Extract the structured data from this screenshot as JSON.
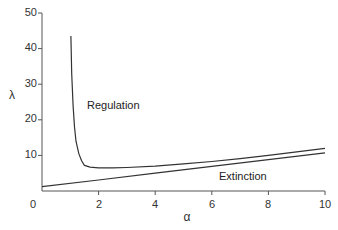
{
  "chart_data": {
    "type": "line",
    "title": "",
    "xlabel": "α",
    "ylabel": "λ",
    "xlim": [
      0,
      10
    ],
    "ylim": [
      0,
      50
    ],
    "xticks": [
      0,
      2,
      4,
      6,
      8,
      10
    ],
    "yticks": [
      10,
      20,
      30,
      40,
      50
    ],
    "xtick_labels": [
      "0",
      "2",
      "4",
      "6",
      "8",
      "10"
    ],
    "ytick_labels": [
      "10",
      "20",
      "30",
      "40",
      "50"
    ],
    "grid": false,
    "legend": null,
    "annotations": [
      {
        "text": "Regulation",
        "x": 2.8,
        "y": 32
      },
      {
        "text": "Extinction",
        "x": 7.3,
        "y": 4.5
      }
    ],
    "series": [
      {
        "name": "upper boundary",
        "x": [
          1.02,
          1.05,
          1.1,
          1.15,
          1.2,
          1.3,
          1.4,
          1.5,
          1.7,
          2.0,
          2.5,
          3,
          4,
          5,
          6,
          7,
          8,
          9,
          10
        ],
        "y": [
          43.5,
          33,
          24,
          18,
          14,
          10.5,
          8.5,
          7.2,
          6.7,
          6.5,
          6.5,
          6.6,
          7.0,
          7.6,
          8.3,
          9.1,
          10.0,
          11.0,
          12.0
        ]
      },
      {
        "name": "lower boundary",
        "x": [
          0,
          2,
          4,
          6,
          8,
          10
        ],
        "y": [
          1.2,
          3.1,
          5.0,
          6.9,
          8.8,
          10.7
        ]
      }
    ]
  },
  "labels": {
    "regulation": "Regulation",
    "extinction": "Extinction",
    "xlabel": "α",
    "ylabel": "λ",
    "x0": "0",
    "x2": "2",
    "x4": "4",
    "x6": "6",
    "x8": "8",
    "x10": "10",
    "y10": "10",
    "y20": "20",
    "y30": "30",
    "y40": "40",
    "y50": "50"
  }
}
